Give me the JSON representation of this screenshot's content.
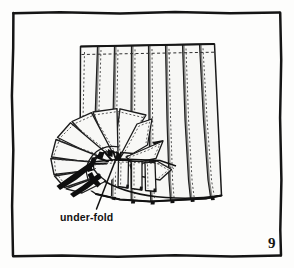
{
  "figure": {
    "page_number": "9",
    "caption": "under-fold",
    "background_color": "#fdfdfc",
    "ink_color": "#141414",
    "fabric_fill": "#f7f7f5",
    "shadow_color": "#101010",
    "border": {
      "name": "hand-drawn-rectangle-frame",
      "stroke_color": "#141414",
      "left": 12,
      "top": 12,
      "right": 281,
      "bottom": 256
    },
    "annotation": {
      "label": "under-fold",
      "label_x": 60,
      "label_y": 220,
      "arrow_from_x": 96,
      "arrow_from_y": 210,
      "arrow_to_x": 118,
      "arrow_to_y": 152
    },
    "pleat_panel_count": 8,
    "fan_segment_count": 8,
    "drawing_elements": [
      "vertical-pleat-panels",
      "horizontal-dashed-stitch-line",
      "fan-rosette-segments",
      "under-fold-shadow-wedges",
      "leader-arrow",
      "caption-label",
      "page-number"
    ]
  }
}
